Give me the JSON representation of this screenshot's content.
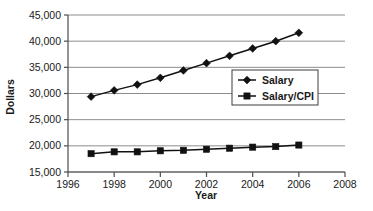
{
  "chart_data": {
    "type": "line",
    "title": "",
    "xlabel": "Year",
    "ylabel": "Dollars",
    "xlim": [
      1996,
      2008
    ],
    "ylim": [
      15000,
      45000
    ],
    "grid": true,
    "legend_position": "center-right",
    "xticks": [
      "1996",
      "1998",
      "2000",
      "2002",
      "2004",
      "2006",
      "2008"
    ],
    "xtick_values": [
      1996,
      1998,
      2000,
      2002,
      2004,
      2006,
      2008
    ],
    "yticks": [
      "15,000",
      "20,000",
      "25,000",
      "30,000",
      "35,000",
      "40,000",
      "45,000"
    ],
    "ytick_values": [
      15000,
      20000,
      25000,
      30000,
      35000,
      40000,
      45000
    ],
    "x": [
      1997,
      1998,
      1999,
      2000,
      2001,
      2002,
      2003,
      2004,
      2005,
      2006
    ],
    "series": [
      {
        "name": "Salary",
        "marker": "diamond",
        "color": "#111111",
        "values": [
          29400,
          30600,
          31700,
          33000,
          34400,
          35800,
          37200,
          38600,
          40000,
          41600
        ]
      },
      {
        "name": "Salary/CPI",
        "marker": "square",
        "color": "#111111",
        "values": [
          18500,
          18850,
          18850,
          19050,
          19150,
          19350,
          19550,
          19750,
          19850,
          20150
        ]
      }
    ]
  },
  "legend": {
    "entries": [
      {
        "label": "Salary"
      },
      {
        "label": "Salary/CPI"
      }
    ]
  },
  "axes": {
    "x_title": "Year",
    "y_title": "Dollars"
  },
  "colors": {
    "line": "#111111",
    "grid": "#8c8c8c",
    "axis": "#4d4d4d",
    "background": "#ffffff",
    "legend_border": "#3d3d3d"
  }
}
